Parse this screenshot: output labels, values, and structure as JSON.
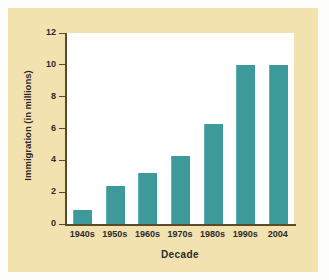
{
  "chart_data": {
    "type": "bar",
    "title": "",
    "subtitle": "",
    "xlabel": "Decade",
    "ylabel": "Immigration (in millions)",
    "categories": [
      "1940s",
      "1950s",
      "1960s",
      "1970s",
      "1980s",
      "1990s",
      "2004"
    ],
    "values": [
      0.9,
      2.4,
      3.2,
      4.3,
      6.3,
      10.0,
      10.0
    ],
    "series": [
      {
        "name": "Immigration",
        "values": [
          0.9,
          2.4,
          3.2,
          4.3,
          6.3,
          10.0,
          10.0
        ]
      }
    ],
    "ylim": [
      0,
      12
    ],
    "ytick_labels": [
      "0",
      "2",
      "4",
      "6",
      "8",
      "10",
      "12"
    ],
    "ytick_values": [
      0,
      2,
      4,
      6,
      8,
      10,
      12
    ],
    "grid": false,
    "legend": null,
    "legend_position": "none",
    "annotations": []
  },
  "style": {
    "bar_color": "#3C9A9A",
    "bar_highlight": "#63B2B2",
    "card_background": "#F2E2B0",
    "plot_background": "#FFFFFF",
    "axis_color": "#5A4A2A",
    "text_color": "#2B2B2B",
    "page_background": "#FDFDFB"
  }
}
